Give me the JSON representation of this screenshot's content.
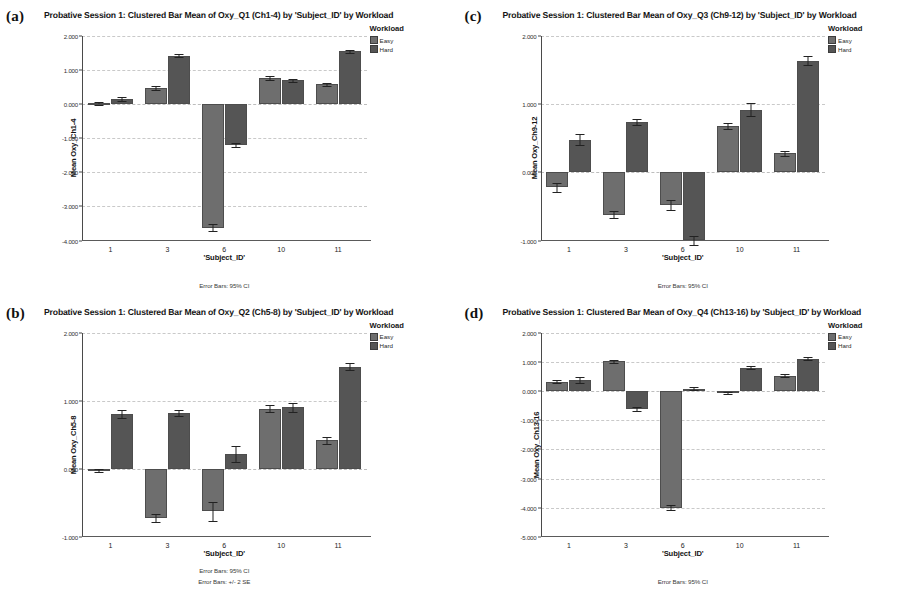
{
  "figure": {
    "background": "#ffffff",
    "series_colors": {
      "Easy": "#6e6e6e",
      "Hard": "#555555"
    },
    "panels": [
      {
        "letter": "(a)",
        "title": "Probative Session 1: Clustered Bar Mean of Oxy_Q1 (Ch1-4) by 'Subject_ID' by Workload",
        "legend_title": "Workload",
        "y_title": "Mean Oxy_Ch1-4",
        "x_title": "'Subject_ID'",
        "footnotes": [
          "Error Bars: 95% CI"
        ],
        "chart_data": {
          "type": "bar",
          "title": "Probative Session 1: Clustered Bar Mean of Oxy_Q1 (Ch1-4) by 'Subject_ID' by Workload",
          "xlabel": "'Subject_ID'",
          "ylabel": "Mean Oxy_Ch1-4",
          "categories": [
            "1",
            "3",
            "6",
            "10",
            "11"
          ],
          "ylim": [
            -4.0,
            2.0
          ],
          "yticks": [
            2.0,
            1.0,
            0.0,
            -1.0,
            -2.0,
            -3.0,
            -4.0
          ],
          "ytick_labels": [
            "2.000",
            "1.000",
            "0.000",
            "-1.000",
            "-2.000",
            "-3.000",
            "-4.000"
          ],
          "grid": true,
          "legend_position": "right",
          "series": [
            {
              "name": "Easy",
              "values": [
                0.02,
                0.48,
                -3.62,
                0.78,
                0.58
              ],
              "errors": [
                0.03,
                0.06,
                0.1,
                0.06,
                0.04
              ]
            },
            {
              "name": "Hard",
              "values": [
                0.14,
                1.42,
                -1.2,
                0.7,
                1.55
              ],
              "errors": [
                0.06,
                0.05,
                0.07,
                0.05,
                0.05
              ]
            }
          ]
        }
      },
      {
        "letter": "(c)",
        "title": "Probative Session 1: Clustered Bar Mean of Oxy_Q3 (Ch9-12) by 'Subject_ID' by Workload",
        "legend_title": "Workload",
        "y_title": "Mean Oxy_Ch9-12",
        "x_title": "'Subject_ID'",
        "footnotes": [
          "Error Bars: 95% CI"
        ],
        "chart_data": {
          "type": "bar",
          "title": "Probative Session 1: Clustered Bar Mean of Oxy_Q3 (Ch9-12) by 'Subject_ID' by Workload",
          "xlabel": "'Subject_ID'",
          "ylabel": "Mean Oxy_Ch9-12",
          "categories": [
            "1",
            "3",
            "6",
            "10",
            "11"
          ],
          "ylim": [
            -1.0,
            2.0
          ],
          "yticks": [
            2.0,
            1.0,
            0.0,
            -1.0
          ],
          "ytick_labels": [
            "2.000",
            "1.000",
            "0.000",
            "-1.000"
          ],
          "grid": true,
          "legend_position": "right",
          "series": [
            {
              "name": "Easy",
              "values": [
                -0.22,
                -0.62,
                -0.48,
                0.68,
                0.28
              ],
              "errors": [
                0.07,
                0.05,
                0.07,
                0.04,
                0.04
              ]
            },
            {
              "name": "Hard",
              "values": [
                0.48,
                0.74,
                -1.0,
                0.92,
                1.64
              ],
              "errors": [
                0.08,
                0.04,
                0.06,
                0.1,
                0.06
              ]
            }
          ]
        }
      },
      {
        "letter": "(b)",
        "title": "Probative Session 1: Clustered Bar Mean of Oxy_Q2 (Ch5-8) by 'Subject_ID' by Workload",
        "legend_title": "Workload",
        "y_title": "Mean Oxy_Ch5-8",
        "x_title": "'Subject_ID'",
        "footnotes": [
          "Error Bars: 95% CI",
          "Error Bars: +/- 2 SE"
        ],
        "chart_data": {
          "type": "bar",
          "title": "Probative Session 1: Clustered Bar Mean of Oxy_Q2 (Ch5-8) by 'Subject_ID' by Workload",
          "xlabel": "'Subject_ID'",
          "ylabel": "Mean Oxy_Ch5-8",
          "categories": [
            "1",
            "3",
            "6",
            "10",
            "11"
          ],
          "ylim": [
            -1.0,
            2.0
          ],
          "yticks": [
            2.0,
            1.0,
            0.0,
            -1.0
          ],
          "ytick_labels": [
            "2.000",
            "1.000",
            "0.000",
            "-1.000"
          ],
          "grid": true,
          "legend_position": "right",
          "series": [
            {
              "name": "Easy",
              "values": [
                -0.02,
                -0.72,
                -0.62,
                0.88,
                0.42
              ],
              "errors": [
                0.02,
                0.06,
                0.14,
                0.05,
                0.05
              ]
            },
            {
              "name": "Hard",
              "values": [
                0.8,
                0.82,
                0.22,
                0.9,
                1.5
              ],
              "errors": [
                0.06,
                0.04,
                0.12,
                0.06,
                0.05
              ]
            }
          ]
        }
      },
      {
        "letter": "(d)",
        "title": "Probative Session 1: Clustered Bar Mean of Oxy_Q4 (Ch13-16) by 'Subject_ID' by Workload",
        "legend_title": "Workload",
        "y_title": "Mean Oxy_Ch13-16",
        "x_title": "'Subject_ID'",
        "footnotes": [
          "Error Bars: 95% CI"
        ],
        "chart_data": {
          "type": "bar",
          "title": "Probative Session 1: Clustered Bar Mean of Oxy_Q4 (Ch13-16) by 'Subject_ID' by Workload",
          "xlabel": "'Subject_ID'",
          "ylabel": "Mean Oxy_Ch13-16",
          "categories": [
            "1",
            "3",
            "6",
            "10",
            "11"
          ],
          "ylim": [
            -5.0,
            2.0
          ],
          "yticks": [
            2.0,
            1.0,
            0.0,
            -1.0,
            -2.0,
            -3.0,
            -4.0,
            -5.0
          ],
          "ytick_labels": [
            "2.000",
            "1.000",
            "0.000",
            "-1.000",
            "-2.000",
            "-3.000",
            "-4.000",
            "-5.000"
          ],
          "grid": true,
          "legend_position": "right",
          "series": [
            {
              "name": "Easy",
              "values": [
                0.32,
                1.02,
                -4.0,
                -0.08,
                0.52
              ],
              "errors": [
                0.06,
                0.05,
                0.08,
                0.04,
                0.05
              ]
            },
            {
              "name": "Hard",
              "values": [
                0.38,
                -0.62,
                0.08,
                0.8,
                1.1
              ],
              "errors": [
                0.1,
                0.08,
                0.04,
                0.05,
                0.05
              ]
            }
          ]
        }
      }
    ]
  }
}
